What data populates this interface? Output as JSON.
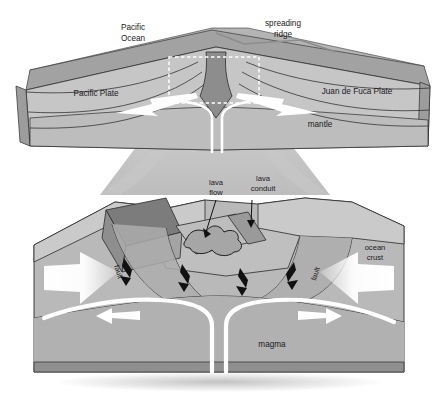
{
  "figure": {
    "panels": [
      "overview-block",
      "detail-block"
    ]
  },
  "palette": {
    "background": "#ffffff",
    "water_top": "#b9b9b9",
    "water_face": "#9e9e9e",
    "crust_light": "#d8d8d8",
    "crust_mid": "#c2c2c2",
    "mantle": "#b0b0b0",
    "mantle_dark": "#9a9a9a",
    "rift_dark": "#8a8a8a",
    "block_dark": "#7e7e7e",
    "seafloor": "#c8c8c8",
    "funnel": "#c0c0c0",
    "arrow_white": "#ffffff",
    "arrow_black": "#111111",
    "outline": "#2b2b2b",
    "lava": "#a8a8a8",
    "shadow": "#d4d4d4"
  },
  "overview": {
    "labels": {
      "ocean": "Pacific\nOcean",
      "ocean_line1": "Pacific",
      "ocean_line2": "Ocean",
      "ridge_line1": "spreading",
      "ridge_line2": "ridge",
      "left_plate": "Pacific Plate",
      "right_plate": "Juan de Fuca Plate",
      "mantle": "mantle"
    },
    "inset_box": "dashed-white-zoom-box",
    "arrows": [
      {
        "name": "plate-motion-left",
        "direction": "left",
        "color": "#ffffff"
      },
      {
        "name": "plate-motion-right",
        "direction": "right",
        "color": "#ffffff"
      }
    ]
  },
  "detail": {
    "labels": {
      "lava_flow_line1": "lava",
      "lava_flow_line2": "flow",
      "lava_conduit_line1": "lava",
      "lava_conduit_line2": "conduit",
      "ocean_crust_line1": "ocean",
      "ocean_crust_line2": "crust",
      "fault_left": "fault",
      "fault_right": "fault",
      "magma": "magma"
    },
    "arrows": [
      {
        "name": "spreading-arrow-left",
        "direction": "left",
        "color": "#ffffff",
        "size": "large"
      },
      {
        "name": "spreading-arrow-right",
        "direction": "right",
        "color": "#ffffff",
        "size": "large"
      },
      {
        "name": "magma-flow-left",
        "direction": "left",
        "color": "#ffffff",
        "size": "medium"
      },
      {
        "name": "magma-flow-right",
        "direction": "right",
        "color": "#ffffff",
        "size": "medium"
      },
      {
        "name": "fault-slip-1",
        "direction": "down",
        "color": "#111111",
        "size": "small"
      },
      {
        "name": "fault-slip-2",
        "direction": "down",
        "color": "#111111",
        "size": "small"
      },
      {
        "name": "fault-slip-3",
        "direction": "down",
        "color": "#111111",
        "size": "small"
      },
      {
        "name": "fault-slip-4",
        "direction": "down",
        "color": "#111111",
        "size": "small"
      }
    ],
    "magma_conduit": "inverted-Y white channel rising to ridge axis"
  }
}
